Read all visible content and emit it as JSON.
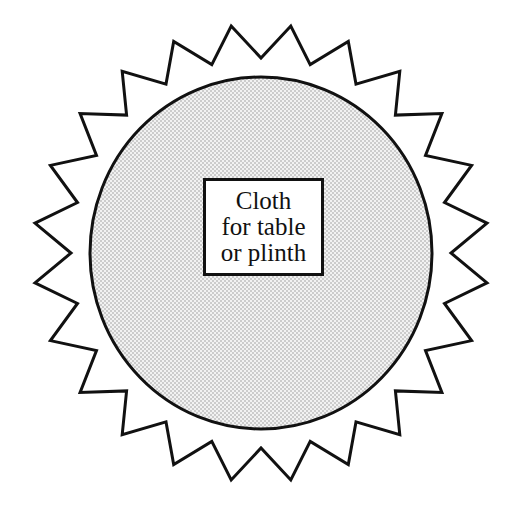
{
  "diagram": {
    "label_lines": [
      "Cloth",
      "for table",
      "or plinth"
    ],
    "spike_count": 24,
    "colors": {
      "stroke": "#111111",
      "fill_pattern_dot": "#8a8a8a",
      "fill_background": "#f2f2f2",
      "page_background": "#ffffff"
    }
  }
}
